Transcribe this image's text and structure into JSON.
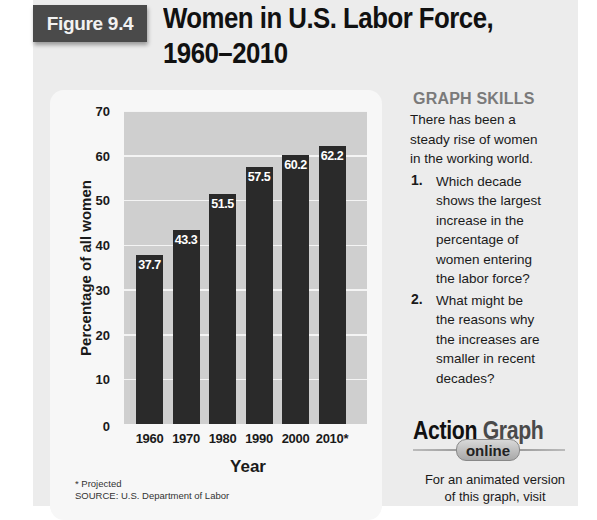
{
  "figure": {
    "badge": "Figure 9.4",
    "title_line1": "Women in U.S. Labor Force,",
    "title_line2": "1960–2010"
  },
  "chart_data": {
    "type": "bar",
    "title": "Women in U.S. Labor Force, 1960–2010",
    "categories": [
      "1960",
      "1970",
      "1980",
      "1990",
      "2000",
      "2010*"
    ],
    "values": [
      37.7,
      43.3,
      51.5,
      57.5,
      60.2,
      62.2
    ],
    "value_labels": [
      "37.7",
      "43.3",
      "51.5",
      "57.5",
      "60.2",
      "62.2"
    ],
    "xlabel": "Year",
    "ylabel": "Percentage of all women",
    "ylim": [
      0,
      70
    ],
    "yticks": [
      "0",
      "10",
      "20",
      "30",
      "40",
      "50",
      "60",
      "70"
    ],
    "grid": true,
    "legend": null,
    "bar_color": "#2a2a2a",
    "plot_bg": "#cfcfcf",
    "footnote": "* Projected",
    "source": "SOURCE: U.S. Department of Labor"
  },
  "sidebar": {
    "heading": "GRAPH SKILLS",
    "intro": [
      "There has been a",
      "steady rise of women",
      "in the working world."
    ],
    "questions": [
      {
        "num": "1.",
        "lines": [
          "Which decade",
          "shows the largest",
          "increase in the",
          "percentage of",
          "women entering",
          "the labor force?"
        ]
      },
      {
        "num": "2.",
        "lines": [
          "What might be",
          "the reasons why",
          "the increases are",
          "smaller in recent",
          "decades?"
        ]
      }
    ],
    "action_graph": {
      "word1": "Action",
      "word2": "Graph",
      "pill": "online"
    },
    "visit": [
      "For an animated version",
      "of this graph, visit"
    ]
  }
}
